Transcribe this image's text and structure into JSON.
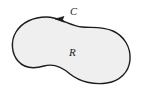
{
  "figure": {
    "type": "math-diagram",
    "background_color": "#ffffff",
    "region": {
      "label": "R",
      "fill_color": "#efefef",
      "label_x": 69,
      "label_y": 56
    },
    "boundary_curve": {
      "label": "C",
      "stroke_color": "#1c1c1c",
      "stroke_width": 1.4,
      "orientation": "counterclockwise",
      "label_x": 70,
      "label_y": 15
    },
    "arrow": {
      "name": "orientation-arrow",
      "direction": "left",
      "color": "#1c1c1c",
      "tip_x": 55,
      "tip_y": 19
    }
  }
}
